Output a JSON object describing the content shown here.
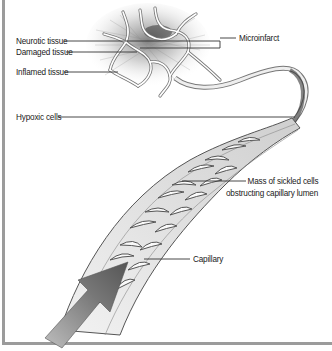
{
  "figure": {
    "labels": {
      "neurotic_tissue": "Neurotic tissue",
      "damaged_tissue": "Damaged tissue",
      "inflamed_tissue": "Inflamed tissue",
      "hypoxic_cells": "Hypoxic cells",
      "microinfarct": "Microinfarct",
      "mass_line1": "Mass of sickled cells",
      "mass_line2": "obstructing capillary lumen",
      "capillary": "Capillary"
    },
    "icons": {
      "flow_arrow": "blood-flow-arrow-icon"
    },
    "colors": {
      "frame": "#9b9b9b",
      "ink": "#222222",
      "shade": "#7a7a7a"
    }
  }
}
